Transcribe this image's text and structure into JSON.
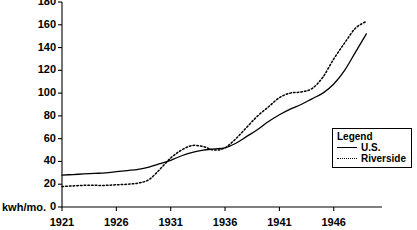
{
  "axis_unit_label": "kwh/mo.",
  "legend": {
    "title": "Legend",
    "entries": [
      {
        "label": "U.S.",
        "style": "solid"
      },
      {
        "label": "Riverside",
        "style": "dotted"
      }
    ]
  },
  "chart_data": {
    "type": "line",
    "title": "",
    "xlabel": "",
    "ylabel": "kwh/mo.",
    "xlim": [
      1921,
      1949
    ],
    "ylim": [
      0,
      180
    ],
    "ytick_labels": [
      "0",
      "20",
      "40",
      "60",
      "80",
      "100",
      "120",
      "140",
      "160",
      "180"
    ],
    "yticks": [
      0,
      20,
      40,
      60,
      80,
      100,
      120,
      140,
      160,
      180
    ],
    "xtick_labels": [
      "1921",
      "1926",
      "1931",
      "1936",
      "1941",
      "1946"
    ],
    "xticks": [
      1921,
      1926,
      1931,
      1936,
      1941,
      1946
    ],
    "grid": false,
    "legend_position": "right-middle",
    "x": [
      1921,
      1922,
      1923,
      1924,
      1925,
      1926,
      1927,
      1928,
      1929,
      1930,
      1931,
      1932,
      1933,
      1934,
      1935,
      1936,
      1937,
      1938,
      1939,
      1940,
      1941,
      1942,
      1943,
      1944,
      1945,
      1946,
      1947,
      1948,
      1949
    ],
    "series": [
      {
        "name": "U.S.",
        "style": "solid",
        "color": "#000000",
        "values": [
          28,
          28.5,
          29,
          29.5,
          30,
          31,
          32,
          33,
          35,
          38,
          41,
          45,
          48,
          50,
          51,
          52,
          56,
          62,
          68,
          75,
          81,
          86,
          90,
          95,
          100,
          108,
          120,
          136,
          152
        ]
      },
      {
        "name": "Riverside",
        "style": "dotted",
        "color": "#000000",
        "values": [
          18,
          18.5,
          19,
          19,
          19,
          19.5,
          20,
          21,
          24,
          33,
          43,
          50,
          54,
          53,
          50,
          52,
          60,
          70,
          80,
          88,
          96,
          100,
          101,
          104,
          114,
          130,
          144,
          157,
          163
        ]
      }
    ]
  }
}
